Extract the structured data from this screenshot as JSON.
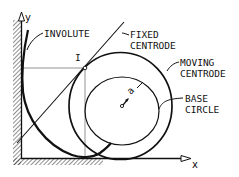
{
  "diagram": {
    "type": "geometric construction — involute of a circle with centrodes",
    "axes": {
      "x_label": "x",
      "y_label": "y"
    },
    "labels": {
      "involute": "INVOLUTE",
      "fixed_centrode_line1": "FIXED",
      "fixed_centrode_line2": "CENTRODE",
      "moving_centrode_line1": "MOVING",
      "moving_centrode_line2": "CENTRODE",
      "base_circle_line1": "BASE",
      "base_circle_line2": "CIRCLE",
      "instant_center": "I",
      "radius": "a"
    },
    "colors": {
      "ink": "#111111",
      "background": "#ffffff",
      "thin_line": "#555555"
    }
  }
}
